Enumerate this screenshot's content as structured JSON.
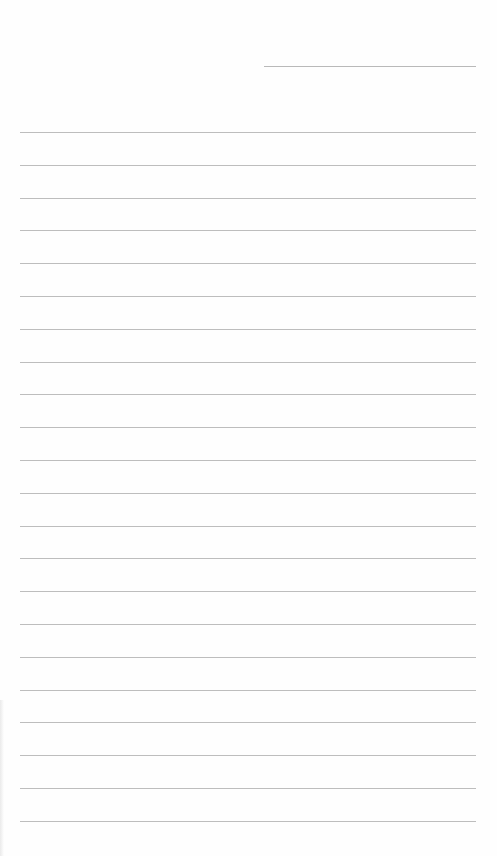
{
  "page": {
    "type": "blank lined paper",
    "background_color": "#fefefe",
    "line_color": "#bdbdbd"
  },
  "header_line": {
    "present": true
  },
  "rules": {
    "count": 22
  }
}
